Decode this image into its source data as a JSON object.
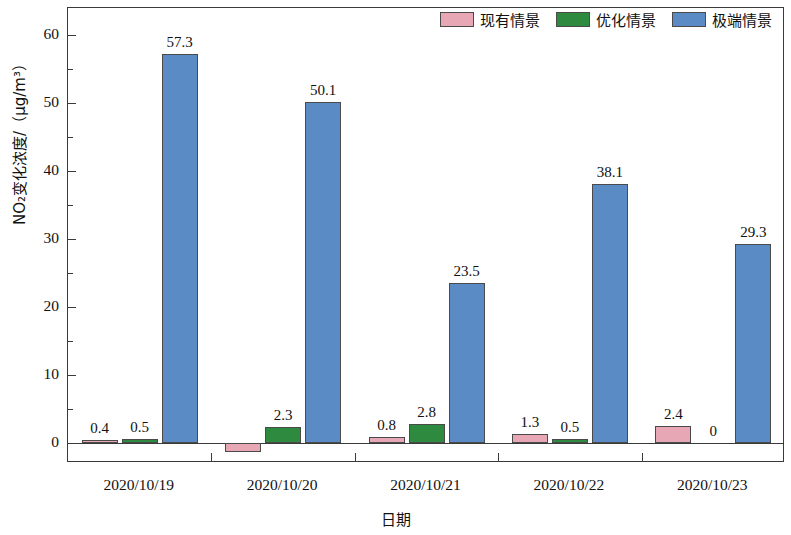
{
  "legend": {
    "items": [
      {
        "label": "现有情景",
        "color": "#e7a7b5",
        "name": "current-scenario"
      },
      {
        "label": "优化情景",
        "color": "#2d8a3e",
        "name": "optimized-scenario"
      },
      {
        "label": "极端情景",
        "color": "#5b8bc4",
        "name": "extreme-scenario"
      }
    ]
  },
  "axes": {
    "y_title": "NO₂变化浓度/（μg/m³）",
    "x_title": "日期",
    "y_ticks": [
      "0",
      "10",
      "20",
      "30",
      "40",
      "50",
      "60"
    ],
    "y_minor_count": 1,
    "x_ticks": [
      "2020/10/19",
      "2020/10/20",
      "2020/10/21",
      "2020/10/22",
      "2020/10/23"
    ]
  },
  "chart_data": {
    "type": "bar",
    "title": "",
    "xlabel": "日期",
    "ylabel": "NO₂变化浓度/（μg/m³）",
    "categories": [
      "2020/10/19",
      "2020/10/20",
      "2020/10/21",
      "2020/10/22",
      "2020/10/23"
    ],
    "ylim": [
      -3,
      64
    ],
    "ytick_values": [
      0,
      10,
      20,
      30,
      40,
      50,
      60
    ],
    "grid": false,
    "legend_position": "top-right",
    "series": [
      {
        "name": "现有情景",
        "color": "#e7a7b5",
        "values": [
          0.4,
          -1.4,
          0.8,
          1.3,
          2.4
        ],
        "labels": [
          "0.4",
          "",
          "0.8",
          "1.3",
          "2.4"
        ]
      },
      {
        "name": "优化情景",
        "color": "#2d8a3e",
        "values": [
          0.5,
          2.3,
          2.8,
          0.5,
          0
        ],
        "labels": [
          "0.5",
          "2.3",
          "2.8",
          "0.5",
          "0"
        ]
      },
      {
        "name": "极端情景",
        "color": "#5b8bc4",
        "values": [
          57.3,
          50.1,
          23.5,
          38.1,
          29.3
        ],
        "labels": [
          "57.3",
          "50.1",
          "23.5",
          "38.1",
          "29.3"
        ]
      }
    ]
  }
}
